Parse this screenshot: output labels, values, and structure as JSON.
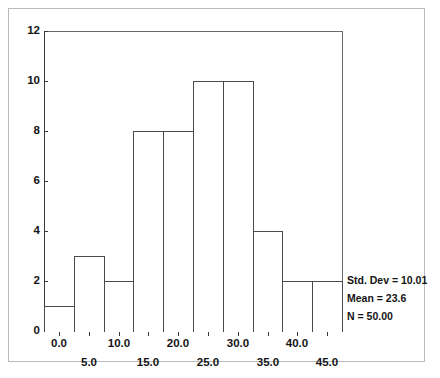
{
  "chart_data": {
    "type": "bar",
    "chart_subtype": "histogram",
    "title": "",
    "subtitle": "",
    "xlabel": "",
    "ylabel": "",
    "bin_width": 5,
    "bin_centers": [
      0.0,
      5.0,
      10.0,
      15.0,
      20.0,
      25.0,
      30.0,
      35.0,
      40.0,
      45.0
    ],
    "bin_edges": [
      -2.5,
      2.5,
      7.5,
      12.5,
      17.5,
      22.5,
      27.5,
      32.5,
      37.5,
      42.5,
      47.5
    ],
    "values": [
      1,
      3,
      2,
      8,
      8,
      10,
      10,
      4,
      2,
      2
    ],
    "categories": [
      "0.0",
      "5.0",
      "10.0",
      "15.0",
      "20.0",
      "25.0",
      "30.0",
      "35.0",
      "40.0",
      "45.0"
    ],
    "xlim": [
      -2.5,
      47.5
    ],
    "ylim": [
      0,
      12
    ],
    "y_ticks": [
      0,
      2,
      4,
      6,
      8,
      10,
      12
    ],
    "y_tick_labels": [
      "0",
      "2",
      "4",
      "6",
      "8",
      "10",
      "12"
    ],
    "x_tick_labels_upper": [
      "0.0",
      "10.0",
      "20.0",
      "30.0",
      "40.0"
    ],
    "x_tick_labels_upper_values": [
      0.0,
      10.0,
      20.0,
      30.0,
      40.0
    ],
    "x_tick_labels_lower": [
      "5.0",
      "15.0",
      "25.0",
      "35.0",
      "45.0"
    ],
    "x_tick_labels_lower_values": [
      5.0,
      15.0,
      25.0,
      35.0,
      45.0
    ],
    "grid": false,
    "legend": false,
    "bar_fill_color": "#ffffff",
    "bar_edge_color": "#4a4a4a",
    "axis_color": "#3a3a3a",
    "background_color": "#ffffff",
    "annotations": [
      "Std. Dev = 10.01",
      "Mean = 23.6",
      "N = 50.00"
    ]
  },
  "stats": {
    "std_dev_line": "Std. Dev = 10.01",
    "mean_line": "Mean = 23.6",
    "n_line": "N = 50.00"
  },
  "axes": {
    "y_labels": [
      "12",
      "10",
      "8",
      "6",
      "4",
      "2",
      "0"
    ],
    "x_labels_upper": [
      "0.0",
      "10.0",
      "20.0",
      "30.0",
      "40.0"
    ],
    "x_labels_lower": [
      "5.0",
      "15.0",
      "25.0",
      "35.0",
      "45.0"
    ]
  }
}
